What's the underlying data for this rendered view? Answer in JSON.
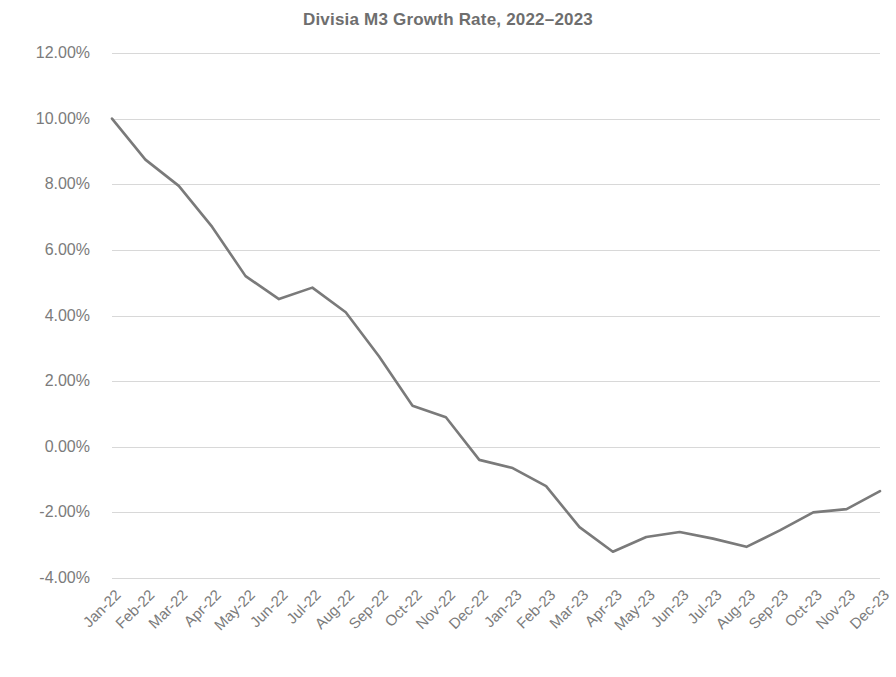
{
  "chart_data": {
    "type": "line",
    "title": "Divisia M3 Growth Rate, 2022–2023",
    "xlabel": "",
    "ylabel": "",
    "ylim": [
      -4.0,
      12.0
    ],
    "ytick_step": 2.0,
    "ytick_labels": [
      "12.00%",
      "10.00%",
      "8.00%",
      "6.00%",
      "4.00%",
      "2.00%",
      "0.00%",
      "-2.00%",
      "-4.00%"
    ],
    "ytick_values": [
      12.0,
      10.0,
      8.0,
      6.0,
      4.0,
      2.0,
      0.0,
      -2.0,
      -4.0
    ],
    "grid": true,
    "grid_axis": "y",
    "legend": false,
    "legend_position": "none",
    "unit": "percent",
    "categories": [
      "Jan-22",
      "Feb-22",
      "Mar-22",
      "Apr-22",
      "May-22",
      "Jun-22",
      "Jul-22",
      "Aug-22",
      "Sep-22",
      "Oct-22",
      "Nov-22",
      "Dec-22",
      "Jan-23",
      "Feb-23",
      "Mar-23",
      "Apr-23",
      "May-23",
      "Jun-23",
      "Jul-23",
      "Aug-23",
      "Sep-23",
      "Oct-23",
      "Nov-23",
      "Dec-23"
    ],
    "series": [
      {
        "name": "Divisia M3 Growth Rate",
        "color": "#7a7a7a",
        "values": [
          10.0,
          8.75,
          7.95,
          6.7,
          5.2,
          4.5,
          4.85,
          4.1,
          2.75,
          1.25,
          0.9,
          -0.4,
          -0.65,
          -1.2,
          -2.45,
          -3.2,
          -2.75,
          -2.6,
          -2.8,
          -3.05,
          -2.55,
          -2.0,
          -1.9,
          -1.35
        ]
      }
    ]
  },
  "style": {
    "line_color": "#7a7a7a",
    "grid_color": "#d8d8d8",
    "text_color": "#7b7b7b",
    "title_color": "#6e6e6e",
    "background": "#ffffff"
  }
}
